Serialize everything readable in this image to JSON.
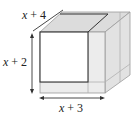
{
  "figure": {
    "type": "box-diagram",
    "labels": {
      "depth": {
        "var": "x",
        "rest": " + 4"
      },
      "height": {
        "var": "x",
        "rest": " + 2"
      },
      "width": {
        "var": "x",
        "rest": " + 3"
      }
    },
    "colors": {
      "line_dark": "#333333",
      "line_light": "#9a9a9a",
      "face_top": "#dcdcdc",
      "face_right": "#e4e4e4",
      "face_front": "#ececec",
      "inner_square": "#ffffff"
    }
  }
}
